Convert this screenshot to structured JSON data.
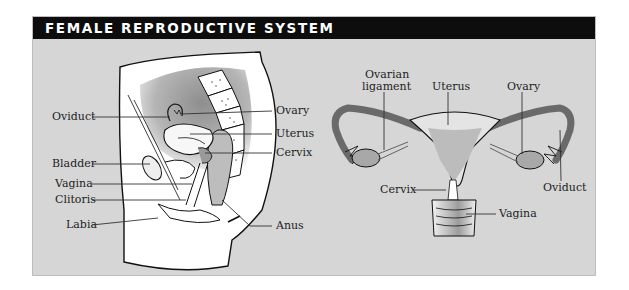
{
  "title": "FEMALE REPRODUCTIVE SYSTEM",
  "colors": {
    "header_bg": "#0d0d0d",
    "header_text": "#ffffff",
    "panel_bg": "#d6d6d6"
  },
  "side_view": {
    "name": "Sagittal section",
    "labels_left": [
      "Oviduct",
      "Bladder",
      "Vagina",
      "Clitoris",
      "Labia"
    ],
    "labels_right": [
      "Ovary",
      "Uterus",
      "Cervix",
      "Anus"
    ]
  },
  "front_view": {
    "name": "Frontal view",
    "labels_top": [
      "Ovarian",
      "ligament",
      "Uterus",
      "Ovary"
    ],
    "labels_bottom": [
      "Cervix",
      "Vagina",
      "Oviduct"
    ]
  }
}
